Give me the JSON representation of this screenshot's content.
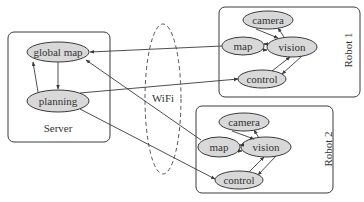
{
  "diagram": {
    "type": "system-architecture",
    "server": {
      "label": "Server",
      "nodes": {
        "global_map": "global map",
        "planning": "planning"
      }
    },
    "wifi": {
      "label": "WiFi"
    },
    "robot1": {
      "label": "Robot 1",
      "nodes": {
        "camera": "camera",
        "map": "map",
        "vision": "vision",
        "control": "control"
      }
    },
    "robot2": {
      "label": "Robot 2",
      "nodes": {
        "camera": "camera",
        "map": "map",
        "vision": "vision",
        "control": "control"
      }
    },
    "edges": [
      {
        "from": "global map",
        "to": "planning"
      },
      {
        "from": "planning",
        "to": "global map"
      },
      {
        "from": "Robot 1 map",
        "to": "global map"
      },
      {
        "from": "Robot 2 map",
        "to": "global map"
      },
      {
        "from": "planning",
        "to": "Robot 1 control"
      },
      {
        "from": "planning",
        "to": "Robot 2 control"
      },
      {
        "from": "camera",
        "to": "vision"
      },
      {
        "from": "vision",
        "to": "camera"
      },
      {
        "from": "vision",
        "to": "map"
      },
      {
        "from": "map",
        "to": "vision"
      },
      {
        "from": "vision",
        "to": "control"
      },
      {
        "from": "control",
        "to": "vision"
      }
    ]
  },
  "colors": {
    "node_fill": "#d8d8d8",
    "stroke": "#3a3a3a",
    "background": "#ffffff"
  }
}
